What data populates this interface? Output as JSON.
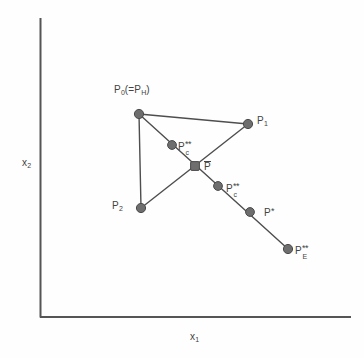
{
  "figure": {
    "type": "simplex-diagram",
    "background": "#fefefe",
    "ink_color": "#4a4a4a",
    "node_color": "#6b6b6b",
    "axes": {
      "origin": [
        40,
        317
      ],
      "x_axis_end": [
        351,
        317
      ],
      "y_axis_top": [
        40,
        18
      ],
      "x_label": "x",
      "x_label_sub": "1",
      "y_label": "x",
      "y_label_sub": "2"
    },
    "points": [
      {
        "id": "P0",
        "x": 139,
        "y": 114,
        "label_base": "P",
        "label_sub": "0",
        "label_tail": "(=P",
        "label_tail_sub": "H",
        "label_close": ")",
        "label_x": 114,
        "label_y": 90
      },
      {
        "id": "P1",
        "x": 248,
        "y": 124,
        "label_base": "P",
        "label_sub": "1",
        "label_x": 256,
        "label_y": 118
      },
      {
        "id": "P2",
        "x": 141,
        "y": 208,
        "label_base": "P",
        "label_sub": "2",
        "label_x": 113,
        "label_y": 203
      },
      {
        "id": "Pcc_upper",
        "x": 172,
        "y": 145,
        "label_base": "P",
        "label_stars": "**",
        "label_sub": "c",
        "label_x": 178,
        "label_y": 141
      },
      {
        "id": "Pbar",
        "x": 195,
        "y": 166,
        "label_base": "P",
        "label_overbar": true,
        "label_x": 204,
        "label_y": 166
      },
      {
        "id": "Pcc_lower",
        "x": 218,
        "y": 186,
        "label_base": "P",
        "label_stars": "**",
        "label_sub": "c",
        "label_x": 226,
        "label_y": 183
      },
      {
        "id": "Pstar",
        "x": 250,
        "y": 212,
        "label_base": "P",
        "label_stars": "*",
        "label_x": 264,
        "label_y": 207
      },
      {
        "id": "PccE",
        "x": 288,
        "y": 249,
        "label_base": "P",
        "label_stars": "**",
        "label_sub": "E",
        "label_x": 295,
        "label_y": 245
      }
    ],
    "edges": [
      {
        "name": "P0-P1",
        "from": "P0",
        "to": "P1"
      },
      {
        "name": "P0-P2",
        "from": "P0",
        "to": "P2"
      },
      {
        "name": "P1-Pbar-P2-ray",
        "from": "P1",
        "to": "P2"
      },
      {
        "name": "P0-to-PccE-ray",
        "from": "P0",
        "to": "PccE"
      }
    ],
    "labels": {
      "p0": "P",
      "p0_sub": "0",
      "p0_eq_open": "(=P",
      "p0_eq_sub": "H",
      "p0_eq_close": ")",
      "p1": "P",
      "p1_sub": "1",
      "p2": "P",
      "p2_sub": "2",
      "pcc_upper": "P",
      "pcc_upper_stars": "**",
      "pcc_upper_sub": "c",
      "pbar": "P",
      "pcc_lower": "P",
      "pcc_lower_stars": "**",
      "pcc_lower_sub": "c",
      "pstar": "P",
      "pstar_stars": "*",
      "pcce": "P",
      "pcce_stars": "**",
      "pcce_sub": "E",
      "x_axis": "x",
      "x_axis_sub": "1",
      "y_axis": "x",
      "y_axis_sub": "2"
    }
  }
}
